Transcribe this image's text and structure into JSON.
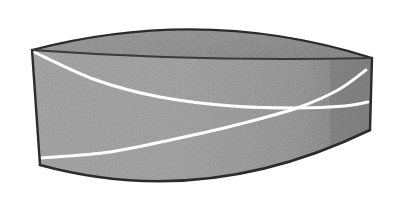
{
  "image": {
    "kind": "line-drawing",
    "subject": "half-cylinder-solid",
    "description": "Grayscale shaded drawing of a half-disc prism (half cylinder lying on its flat rectangular base) seen in three-quarter view from slightly above, with two white curves crossing on the curved lateral surface",
    "width": 395,
    "height": 200,
    "background_color": "#ffffff"
  },
  "palette": {
    "background": "#ffffff",
    "top_face_fill": "#8a8a8a",
    "lateral_face_fill": "#9a9a9a",
    "lateral_face_shadow": "#7c7c7c",
    "right_end_fill": "#787878",
    "outline": "#2b2b2b",
    "inner_rim_line": "#3a3a3a",
    "curve_line": "#fdfdfd",
    "texture_speckle": "#8e8e8e"
  },
  "geometry": {
    "top_back_rim": {
      "label": "back edge of top semicircular face",
      "start": [
        32,
        50
      ],
      "control": [
        205,
        5
      ],
      "end": [
        372,
        58
      ]
    },
    "top_front_rim": {
      "label": "front (diameter) edge of top face, slightly curved",
      "start": [
        32,
        50
      ],
      "control": [
        200,
        62
      ],
      "end": [
        372,
        58
      ]
    },
    "left_edge": {
      "label": "vertical left end of the prism",
      "start": [
        32,
        50
      ],
      "end": [
        40,
        165
      ]
    },
    "right_edge": {
      "label": "vertical right silhouette of the curved surface",
      "start": [
        372,
        58
      ],
      "end": [
        370,
        130
      ]
    },
    "bottom_rim": {
      "label": "bottom curved edge of lateral surface",
      "start": [
        40,
        165
      ],
      "control": [
        205,
        210
      ],
      "end": [
        370,
        130
      ]
    }
  },
  "curves": [
    {
      "name": "upper-geodesic-curve",
      "label": "white curve descending from the top-left corner toward the right",
      "color": "#fdfdfd",
      "stroke_width": 3,
      "path_points": [
        [
          34,
          52
        ],
        [
          96,
          80
        ],
        [
          160,
          97
        ],
        [
          232,
          106
        ],
        [
          297,
          108
        ],
        [
          345,
          106
        ],
        [
          368,
          102
        ]
      ]
    },
    {
      "name": "lower-geodesic-curve",
      "label": "white curve rising from the lower-left edge up to the upper right",
      "color": "#fdfdfd",
      "stroke_width": 3,
      "path_points": [
        [
          42,
          158
        ],
        [
          110,
          152
        ],
        [
          175,
          139
        ],
        [
          240,
          124
        ],
        [
          297,
          108
        ],
        [
          338,
          90
        ],
        [
          366,
          70
        ]
      ]
    }
  ],
  "intersection": {
    "label": "crossing point of the two white curves",
    "x": 297,
    "y": 108
  },
  "annotations": {
    "has_text": false,
    "labels": [],
    "axis_labels": [],
    "legend": []
  }
}
